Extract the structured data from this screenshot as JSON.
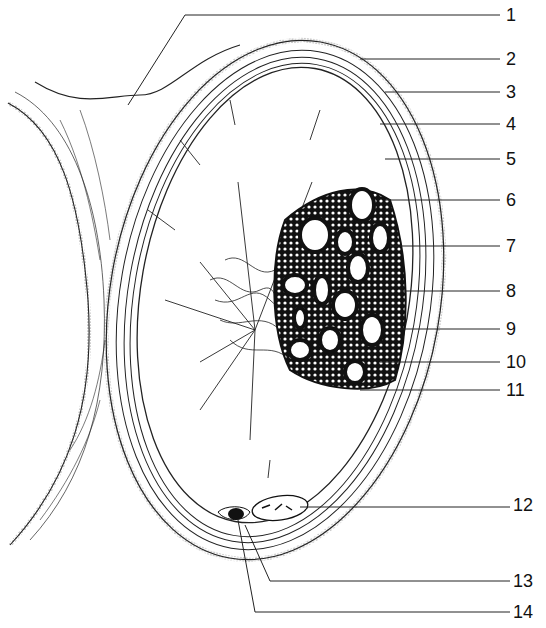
{
  "diagram": {
    "type": "anatomical cross-section line drawing",
    "labels": [
      {
        "id": 1,
        "text": "1",
        "y": 15
      },
      {
        "id": 2,
        "text": "2",
        "y": 59
      },
      {
        "id": 3,
        "text": "3",
        "y": 92
      },
      {
        "id": 4,
        "text": "4",
        "y": 124
      },
      {
        "id": 5,
        "text": "5",
        "y": 159
      },
      {
        "id": 6,
        "text": "6",
        "y": 200
      },
      {
        "id": 7,
        "text": "7",
        "y": 246
      },
      {
        "id": 8,
        "text": "8",
        "y": 291
      },
      {
        "id": 9,
        "text": "9",
        "y": 329
      },
      {
        "id": 10,
        "text": "10",
        "y": 362
      },
      {
        "id": 11,
        "text": "11",
        "y": 390
      },
      {
        "id": 12,
        "text": "12",
        "y": 505
      },
      {
        "id": 13,
        "text": "13",
        "y": 580
      },
      {
        "id": 14,
        "text": "14",
        "y": 612
      }
    ]
  }
}
